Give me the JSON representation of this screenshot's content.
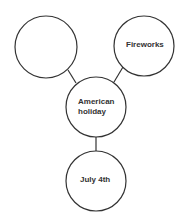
{
  "diagram": {
    "type": "web-organizer",
    "center": {
      "label_line1": "American",
      "label_line2": "holiday"
    },
    "nodes": [
      {
        "id": "top-left",
        "label": ""
      },
      {
        "id": "top-right",
        "label": "Fireworks"
      },
      {
        "id": "bottom",
        "label": "July 4th"
      }
    ]
  }
}
